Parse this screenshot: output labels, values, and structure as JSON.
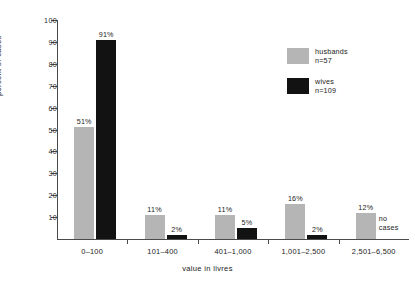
{
  "chart_data": {
    "type": "bar",
    "title": "",
    "xlabel": "value in livres",
    "ylabel": "percent of cases",
    "categories": [
      "0–100",
      "101–400",
      "401–1,000",
      "1,001–2,500",
      "2,501–6,500"
    ],
    "series": [
      {
        "name": "husbands",
        "legend_label": "husbands",
        "legend_n": "n=57",
        "color": "#b5b5b5",
        "values": [
          51,
          11,
          11,
          16,
          12
        ],
        "data_labels": [
          "51%",
          "11%",
          "11%",
          "16%",
          "12%"
        ]
      },
      {
        "name": "wives",
        "legend_label": "wives",
        "legend_n": "n=109",
        "color": "#121212",
        "values": [
          91,
          2,
          5,
          2,
          null
        ],
        "data_labels": [
          "91%",
          "2%",
          "5%",
          "2%",
          ""
        ]
      }
    ],
    "annotations": [
      {
        "text": "no cases",
        "line1": "no",
        "line2": "cases",
        "category": "2,501–6,500",
        "series": "wives"
      }
    ],
    "ylim": [
      0,
      100
    ],
    "yticks": [
      10,
      20,
      30,
      40,
      50,
      60,
      70,
      80,
      90,
      100
    ],
    "ytick_labels": [
      "10",
      "20",
      "30",
      "40",
      "50",
      "60",
      "70",
      "80",
      "90",
      "100"
    ],
    "grid": false,
    "legend_position": "upper-right"
  }
}
